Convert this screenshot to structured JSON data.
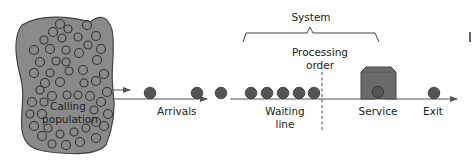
{
  "diagram": {
    "labels": {
      "calling_population_line1": "Calling",
      "calling_population_line2": "population",
      "arrivals": "Arrivals",
      "waiting_line_line1": "Waiting",
      "waiting_line_line2": "line",
      "processing_order_line1": "Processing",
      "processing_order_line2": "order",
      "system": "System",
      "service": "Service",
      "exit": "Exit"
    },
    "colors": {
      "population_fill": "#8a8a8a",
      "customer_fill": "#555555",
      "server_fill": "#6a6a6a",
      "line": "#555555"
    },
    "waiting_line_count": 5,
    "arrivals_count": 3
  }
}
